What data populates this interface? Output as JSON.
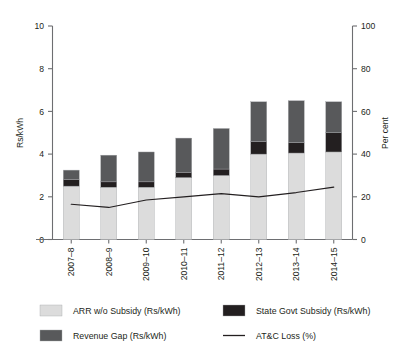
{
  "chart_data": {
    "type": "bar",
    "subtype": "stacked-bar-with-line",
    "title": "",
    "subtitle": "",
    "categories": [
      "2007–8",
      "2008–9",
      "2009–10",
      "2010–11",
      "2011–12",
      "2012–13",
      "2013–14",
      "2014–15"
    ],
    "xlabel": "",
    "ylabel": "Rs/kWh",
    "ylabel_secondary": "Per cent",
    "ylim": [
      0,
      10
    ],
    "ylim_secondary": [
      0,
      100
    ],
    "yticks": [
      0,
      2,
      4,
      6,
      8,
      10
    ],
    "yticks_secondary": [
      0,
      20,
      40,
      60,
      80,
      100
    ],
    "ytick_labels": [
      "0",
      "2",
      "4",
      "6",
      "8",
      "10"
    ],
    "ytick_labels_secondary": [
      "0",
      "20",
      "40",
      "60",
      "80",
      "100"
    ],
    "grid": false,
    "legend_position": "bottom",
    "series": [
      {
        "name": "ARR w/o Subsidy (Rs/kWh)",
        "type": "bar",
        "stack": "total",
        "axis": "left",
        "color": "#dcdcdc",
        "values": [
          2.5,
          2.45,
          2.45,
          2.9,
          3.0,
          4.0,
          4.05,
          4.1
        ]
      },
      {
        "name": "State Govt Subsidy (Rs/kWh)",
        "type": "bar",
        "stack": "total",
        "axis": "left",
        "color": "#231f20",
        "values": [
          0.3,
          0.25,
          0.25,
          0.25,
          0.3,
          0.6,
          0.5,
          0.9
        ]
      },
      {
        "name": "Revenue Gap (Rs/kWh)",
        "type": "bar",
        "stack": "total",
        "axis": "left",
        "color": "#58595b",
        "values": [
          0.45,
          1.25,
          1.4,
          1.6,
          1.9,
          1.85,
          1.95,
          1.45
        ]
      },
      {
        "name": "AT&C Loss (%)",
        "type": "line",
        "axis": "right",
        "color": "#231f20",
        "values": [
          16.5,
          15.0,
          18.5,
          20.0,
          21.5,
          20.0,
          22.0,
          24.5
        ]
      }
    ],
    "bar_totals": [
      3.25,
      3.95,
      4.1,
      4.75,
      5.2,
      6.45,
      6.5,
      6.45
    ]
  },
  "legend": {
    "items": [
      {
        "label": "ARR w/o Subsidy (Rs/kWh)",
        "swatch": "#dcdcdc",
        "marker": "box"
      },
      {
        "label": "State Govt Subsidy (Rs/kWh)",
        "swatch": "#231f20",
        "marker": "box"
      },
      {
        "label": "Revenue Gap (Rs/kWh)",
        "swatch": "#58595b",
        "marker": "box"
      },
      {
        "label": "AT&C Loss (%)",
        "swatch": "#231f20",
        "marker": "line"
      }
    ]
  },
  "colors": {
    "arr": "#dcdcdc",
    "subsidy": "#231f20",
    "gap": "#58595b",
    "line": "#231f20",
    "axis": "#6d6e71",
    "text": "#231f20",
    "background": "#ffffff"
  }
}
